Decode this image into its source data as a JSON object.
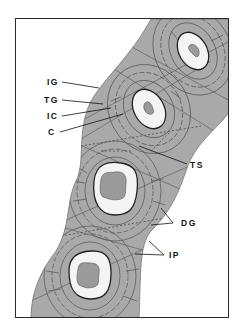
{
  "diagram": {
    "type": "histological cross-section (lamellar bone / haversian systems)",
    "labels": {
      "IG": "IG",
      "TG": "TG",
      "IC": "IC",
      "C": "C",
      "TS": "TS",
      "DG": "DG",
      "IP": "IP"
    },
    "colors": {
      "tissue": "#a9a9a9",
      "tissue_light": "#c4c4c4",
      "lumen_halo": "#f2f2f2",
      "core": "#9a9a9a",
      "lines": "#555555",
      "frame": "#2a2a2a"
    }
  }
}
